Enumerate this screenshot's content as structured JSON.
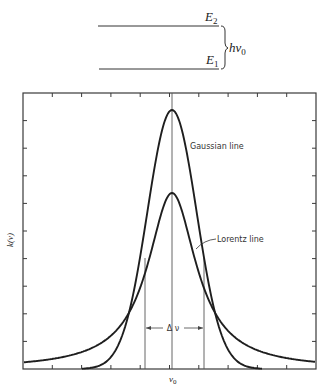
{
  "energy_diagram": {
    "upper_level": {
      "label": "E",
      "sub": "2"
    },
    "lower_level": {
      "label": "E",
      "sub": "1"
    },
    "gap_label": {
      "main": "hν",
      "sub": "0"
    }
  },
  "chart_data": {
    "type": "line",
    "title": "",
    "xlabel": "ν",
    "xlabel_sub": "0",
    "ylabel": "k(ν)",
    "grid": false,
    "x_ticks_count": 10,
    "y_ticks_count": 10,
    "series": [
      {
        "name": "Gaussian line",
        "shape": "gaussian",
        "relative_peak": 1.0,
        "hwhm_px": 29
      },
      {
        "name": "Lorentz line",
        "shape": "lorentzian",
        "relative_peak": 0.68,
        "hwhm_px": 29.5
      }
    ],
    "annotations": [
      {
        "text": "Gaussian line"
      },
      {
        "text": "Lorentz line"
      },
      {
        "text": "Δ ν",
        "meaning": "full width at half maximum"
      }
    ],
    "layout": {
      "left": 23,
      "right": 316,
      "top": 93,
      "bottom": 369,
      "center_x": 172,
      "gaussian_peak_y": 110,
      "lorentz_peak_y": 193,
      "fwhm_left_x": 145,
      "fwhm_right_x": 204,
      "delta_arrow_y": 328
    }
  },
  "labels": {
    "gaussian": "Gaussian line",
    "lorentz": "Lorentz line",
    "delta": "Δ ν",
    "y_axis": "k(ν)",
    "x_center": "ν",
    "x_center_sub": "0"
  }
}
